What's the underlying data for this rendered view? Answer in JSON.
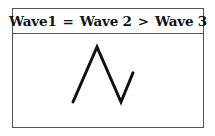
{
  "header": {
    "wave1": "Wave1",
    "op1": "=",
    "wave2": "Wave 2",
    "op2": ">",
    "wave3": "Wave 3"
  },
  "diagram": {
    "stroke_color": "#111111",
    "points": [
      {
        "label": "start",
        "rel_level": 0.0
      },
      {
        "label": "wave1-peak",
        "rel_level": 1.0
      },
      {
        "label": "wave2-trough",
        "rel_level": 0.0
      },
      {
        "label": "wave3-end",
        "rel_level": 0.53
      }
    ]
  }
}
